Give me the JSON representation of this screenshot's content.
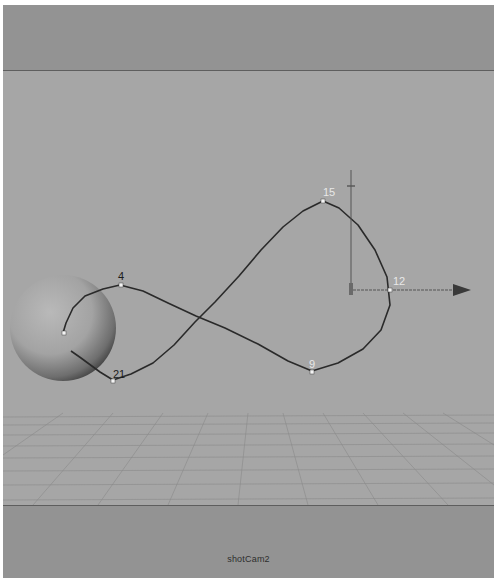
{
  "viewport": {
    "camera_name": "shotCam2",
    "background_color": "#a6a6a6",
    "gate_color": "#939393"
  },
  "scene": {
    "curve": {
      "color": "#2a2a2a",
      "cv_labels": [
        {
          "id": "4",
          "label": "4",
          "color": "#1c1c1c"
        },
        {
          "id": "15",
          "label": "15",
          "color": "#e8e8e8"
        },
        {
          "id": "12",
          "label": "12",
          "color": "#e8e8e8"
        },
        {
          "id": "9",
          "label": "9",
          "color": "#e8e8e8"
        },
        {
          "id": "21",
          "label": "21",
          "color": "#1c1c1c"
        }
      ]
    },
    "sphere": {
      "name": "sphere"
    },
    "manipulator": {
      "name": "move-manipulator"
    }
  }
}
